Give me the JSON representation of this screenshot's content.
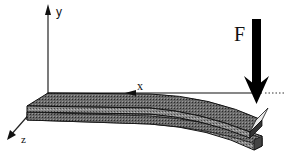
{
  "diagram": {
    "axes": {
      "x_label": "x",
      "y_label": "y",
      "z_label": "z"
    },
    "force": {
      "label": "F",
      "direction": "down"
    },
    "colors": {
      "line": "#111111",
      "beam_fill": "#555555",
      "beam_side": "#777777",
      "background": "#ffffff"
    }
  }
}
